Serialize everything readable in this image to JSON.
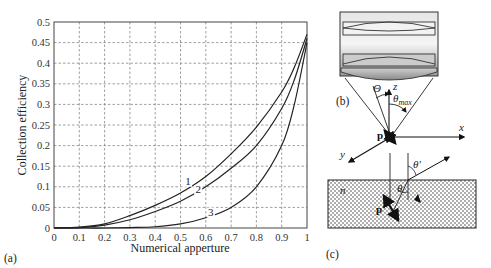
{
  "chart_data": {
    "type": "line",
    "title": "",
    "xlabel": "Numerical apperture",
    "ylabel": "Collection efficiency",
    "xlim": [
      0,
      1
    ],
    "ylim": [
      0,
      0.5
    ],
    "grid": true,
    "x_ticks": [
      "0",
      "0.1",
      "0.2",
      "0.3",
      "0.4",
      "0.5",
      "0.6",
      "0.7",
      "0.8",
      "0.9",
      "1"
    ],
    "y_ticks": [
      "0",
      "0.05",
      "0.1",
      "0.15",
      "0.2",
      "0.25",
      "0.3",
      "0.35",
      "0.4",
      "0.45",
      "0.5"
    ],
    "x": [
      0,
      0.1,
      0.2,
      0.3,
      0.4,
      0.5,
      0.6,
      0.7,
      0.8,
      0.9,
      0.95,
      1.0
    ],
    "series": [
      {
        "name": "1",
        "values": [
          0,
          0.002,
          0.01,
          0.03,
          0.055,
          0.085,
          0.125,
          0.18,
          0.245,
          0.33,
          0.39,
          0.47
        ]
      },
      {
        "name": "2",
        "values": [
          0,
          0.001,
          0.007,
          0.02,
          0.04,
          0.065,
          0.1,
          0.145,
          0.2,
          0.29,
          0.36,
          0.46
        ]
      },
      {
        "name": "3",
        "values": [
          0,
          0,
          0,
          0.001,
          0.003,
          0.01,
          0.025,
          0.05,
          0.1,
          0.2,
          0.3,
          0.45
        ]
      }
    ],
    "curve_labels": [
      {
        "text": "1",
        "x": 0.53,
        "y": 0.105
      },
      {
        "text": "2",
        "x": 0.57,
        "y": 0.085
      },
      {
        "text": "3",
        "x": 0.62,
        "y": 0.03
      }
    ],
    "legend": "none"
  },
  "panels": {
    "a_label": "(a)",
    "b_label": "(b)",
    "c_label": "(c)"
  },
  "diagram": {
    "theta_label": "Θ",
    "theta_max_label": "θ",
    "theta_max_sub": "max",
    "z_label": "z",
    "x_label": "x",
    "y_label": "y",
    "p_label": "p",
    "p_prime_label": "p'",
    "theta_prime_label": "θ'",
    "theta_inner_label": "θ",
    "n_label": "n"
  }
}
